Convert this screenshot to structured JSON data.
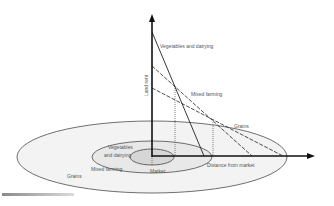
{
  "diagram": {
    "type": "von-thunen-land-rent-model",
    "axes": {
      "y_label": "Land rent",
      "x_label": "Distance from market"
    },
    "rent_curves": [
      {
        "name": "Vegetables and dairying",
        "label": "Vegetables and dairying",
        "style": "solid"
      },
      {
        "name": "Mixed farming",
        "label": "Mixed farming",
        "style": "dashed"
      },
      {
        "name": "Grains",
        "label": "Grains",
        "style": "dashed"
      }
    ],
    "zones": {
      "center": "Market",
      "inner_label_line1": "Vegetables",
      "inner_label_line2": "and dairying",
      "middle": "Mixed farming",
      "outer": "Grains"
    },
    "colors": {
      "line": "#222222",
      "text": "#555555",
      "outer_fill": "#f3f3f3",
      "middle_fill": "#e8e8e8",
      "inner_fill": "#d6d6d6"
    }
  }
}
